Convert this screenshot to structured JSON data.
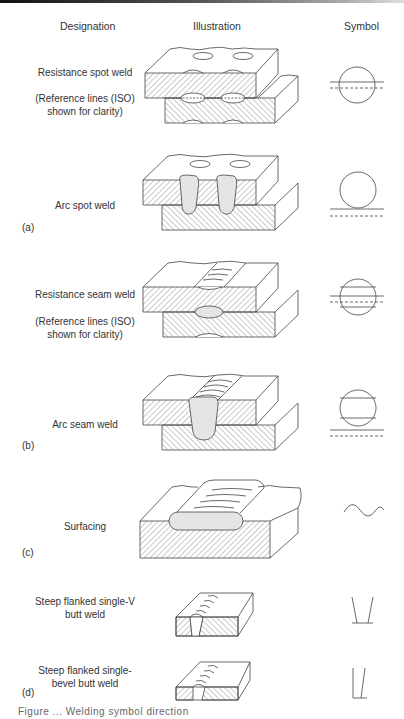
{
  "headers": {
    "designation": "Designation",
    "illustration": "Illustration",
    "symbol": "Symbol"
  },
  "rows": [
    {
      "designation": "Resistance spot weld",
      "note": "(Reference lines (ISO) shown for clarity)",
      "note_line1": "(Reference lines (ISO)",
      "note_line2": "shown for clarity)",
      "symbol": "circle-with-reference-lines-through"
    },
    {
      "designation": "Arc spot weld",
      "group": "(a)",
      "symbol": "circle-on-reference-lines"
    },
    {
      "designation": "Resistance seam weld",
      "note_line1": "(Reference lines (ISO)",
      "note_line2": "shown for clarity)",
      "symbol": "circle-with-two-lines-and-reference-lines-through"
    },
    {
      "designation": "Arc seam weld",
      "group": "(b)",
      "symbol": "circle-with-two-lines-on-reference-lines"
    },
    {
      "designation": "Surfacing",
      "group": "(c)",
      "symbol": "wave"
    },
    {
      "designation_line1": "Steep flanked single-V",
      "designation_line2": "butt weld",
      "symbol": "steep-v"
    },
    {
      "designation_line1": "Steep flanked single-",
      "designation_line2": "bevel butt weld",
      "group": "(d)",
      "symbol": "steep-bevel"
    }
  ],
  "caption": "Figure ... Welding symbol direction",
  "colors": {
    "line": "#444444",
    "hatch": "#666666",
    "weld_fill": "#d9d9d9"
  }
}
